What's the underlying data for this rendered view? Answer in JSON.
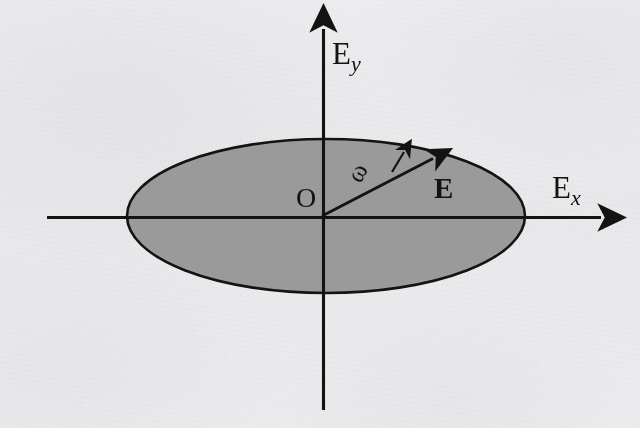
{
  "figure": {
    "kind": "elliptical-polarization-diagram",
    "background_color": "#f5f5f6",
    "ink_color": "#131313",
    "ellipse_fill_color": "#9a9a9a"
  },
  "axes": {
    "vertical": {
      "name": "Ey",
      "label_base": "E",
      "label_sub": "y",
      "from": [
        323,
        410
      ],
      "to": [
        323,
        20
      ]
    },
    "horizontal": {
      "name": "Ex",
      "label_base": "E",
      "label_sub": "x",
      "from": [
        47,
        217
      ],
      "to": [
        610,
        217
      ]
    },
    "origin": {
      "label": "O",
      "at": [
        322,
        216
      ]
    }
  },
  "ellipse": {
    "center": [
      326,
      216
    ],
    "rx": 199,
    "ry": 77,
    "fill": "#9a9a9a",
    "stroke": "#131313",
    "stroke_width": 2.6
  },
  "field_vector": {
    "label": "E",
    "bold": true,
    "from": [
      322,
      216
    ],
    "to": [
      440,
      155
    ],
    "angle_deg": 27.3
  },
  "rotation": {
    "label": "ω",
    "symbol_rotation_deg": -62,
    "arrow_from": [
      392,
      170
    ],
    "arrow_to": [
      406,
      148
    ],
    "sense": "counterclockwise"
  }
}
